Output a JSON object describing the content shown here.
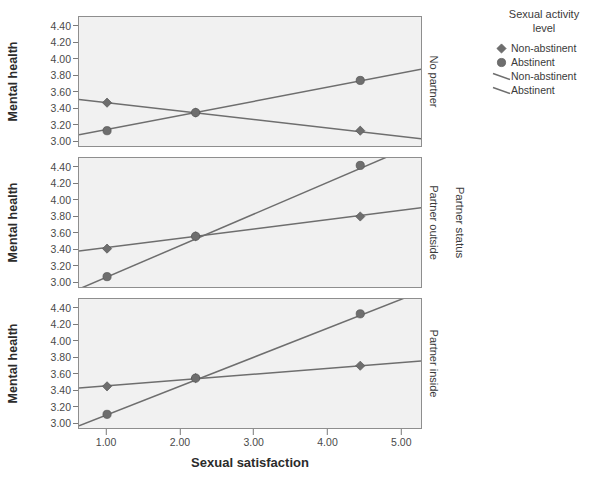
{
  "chart_data": {
    "type": "line",
    "title": "",
    "xlabel": "Sexual satisfaction",
    "ylabel": "Mental health",
    "xlim": [
      0.62,
      5.28
    ],
    "ylim": [
      2.93,
      4.52
    ],
    "xticks": [
      "1.00",
      "2.00",
      "3.00",
      "4.00",
      "5.00"
    ],
    "xtick_values": [
      1.0,
      2.0,
      3.0,
      4.0,
      5.0
    ],
    "yticks": [
      "3.00",
      "3.20",
      "3.40",
      "3.60",
      "3.80",
      "4.00",
      "4.20",
      "4.40"
    ],
    "ytick_values": [
      3.0,
      3.2,
      3.4,
      3.6,
      3.8,
      4.0,
      4.2,
      4.4
    ],
    "grid": false,
    "legend_position": "right",
    "panel_variable": "Partner status",
    "panels": [
      {
        "label": "No partner",
        "series": [
          {
            "name": "Non-abstinent",
            "marker": "diamond",
            "x": [
              1.0,
              2.2,
              4.43
            ],
            "y": [
              3.48,
              3.36,
              3.14
            ],
            "fit_x": [
              0.62,
              5.28
            ],
            "fit_y": [
              3.52,
              3.04
            ]
          },
          {
            "name": "Abstinent",
            "marker": "circle",
            "x": [
              1.0,
              2.2,
              4.43
            ],
            "y": [
              3.14,
              3.36,
              3.75
            ],
            "fit_x": [
              0.62,
              5.28
            ],
            "fit_y": [
              3.09,
              3.89
            ]
          }
        ]
      },
      {
        "label": "Partner outside",
        "series": [
          {
            "name": "Non-abstinent",
            "marker": "diamond",
            "x": [
              1.0,
              2.2,
              4.43
            ],
            "y": [
              3.42,
              3.57,
              3.81
            ],
            "fit_x": [
              0.62,
              5.28
            ],
            "fit_y": [
              3.39,
              3.92
            ]
          },
          {
            "name": "Abstinent",
            "marker": "circle",
            "x": [
              1.0,
              2.2,
              4.43
            ],
            "y": [
              3.08,
              3.57,
              4.43
            ],
            "fit_x": [
              0.62,
              5.28
            ],
            "fit_y": [
              2.93,
              4.72
            ]
          }
        ]
      },
      {
        "label": "Partner inside",
        "series": [
          {
            "name": "Non-abstinent",
            "marker": "diamond",
            "x": [
              1.0,
              2.2,
              4.43
            ],
            "y": [
              3.46,
              3.56,
              3.71
            ],
            "fit_x": [
              0.62,
              5.28
            ],
            "fit_y": [
              3.44,
              3.77
            ]
          },
          {
            "name": "Abstinent",
            "marker": "circle",
            "x": [
              1.0,
              2.2,
              4.43
            ],
            "y": [
              3.12,
              3.56,
              4.34
            ],
            "fit_x": [
              0.62,
              5.28
            ],
            "fit_y": [
              2.98,
              4.62
            ]
          }
        ]
      }
    ]
  },
  "legend": {
    "title": "Sexual activity\nlevel",
    "title_line1": "Sexual activity",
    "title_line2": "level",
    "entries": [
      {
        "label": "Non-abstinent",
        "key": "diamond-marker",
        "type": "marker"
      },
      {
        "label": "Abstinent",
        "key": "circle-marker",
        "type": "marker"
      },
      {
        "label": "Non-abstinent",
        "key": "line-sample",
        "type": "line"
      },
      {
        "label": "Abstinent",
        "key": "line-sample",
        "type": "line"
      }
    ]
  },
  "colors": {
    "panel_background": "#f1f1f1",
    "panel_border": "#8e8e8e",
    "marker": "#6e6e6e",
    "line": "#6e6e6e",
    "text": "#3a3a3a",
    "axis": "#7a7a7a"
  }
}
